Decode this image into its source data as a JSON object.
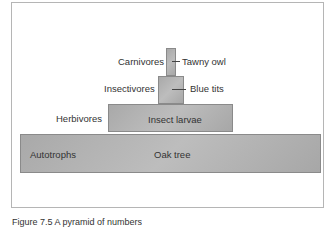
{
  "pyramid": {
    "levels": [
      {
        "trophic_level": "Autotrophs",
        "organism": "Oak tree"
      },
      {
        "trophic_level": "Herbivores",
        "organism": "Insect larvae"
      },
      {
        "trophic_level": "Insectivores",
        "organism": "Blue tits"
      },
      {
        "trophic_level": "Carnivores",
        "organism": "Tawny owl"
      }
    ]
  },
  "caption": "Figure 7.5 A pyramid of numbers"
}
